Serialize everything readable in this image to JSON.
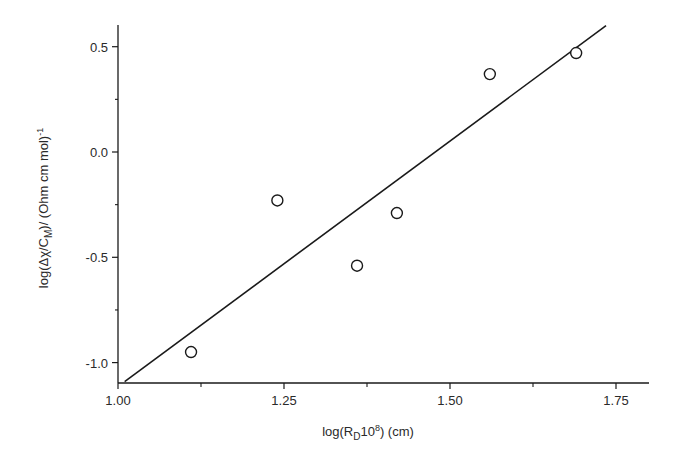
{
  "chart_data": {
    "type": "scatter",
    "title": "",
    "xlabel": "log(R_D 10^8) (cm)",
    "xlabel_parts": {
      "pre": "log(R",
      "sub": "D",
      "mid": "10",
      "sup": "8",
      "post": ") (cm)"
    },
    "ylabel": "log(Δχ/C_M)/ (Ohm cm mol)^-1",
    "ylabel_parts": {
      "pre": "log(Δχ/C",
      "sub": "M",
      "mid": ")/ (Ohm cm mol)",
      "sup": "-1"
    },
    "xlim": [
      1.0,
      1.8
    ],
    "ylim": [
      -1.1,
      0.6
    ],
    "xticks": [
      1.0,
      1.25,
      1.5,
      1.75
    ],
    "xtick_labels": [
      "1.00",
      "1.25",
      "1.50",
      "1.75"
    ],
    "yticks": [
      0.5,
      0.0,
      -0.5,
      -1.0
    ],
    "ytick_labels": [
      "0.5",
      "0.0",
      "-0.5",
      "-1.0"
    ],
    "grid": false,
    "legend": null,
    "series": [
      {
        "name": "data",
        "marker": "open-circle",
        "x": [
          1.11,
          1.24,
          1.36,
          1.42,
          1.56,
          1.69
        ],
        "y": [
          -0.95,
          -0.23,
          -0.54,
          -0.29,
          0.37,
          0.47
        ]
      },
      {
        "name": "linear fit",
        "marker": "line",
        "x": [
          1.01,
          1.735
        ],
        "y": [
          -1.09,
          0.6
        ]
      }
    ],
    "colors": {
      "axis": "#1a1a1a",
      "marker": "#1a1a1a",
      "line": "#1a1a1a",
      "background": "#ffffff"
    }
  }
}
